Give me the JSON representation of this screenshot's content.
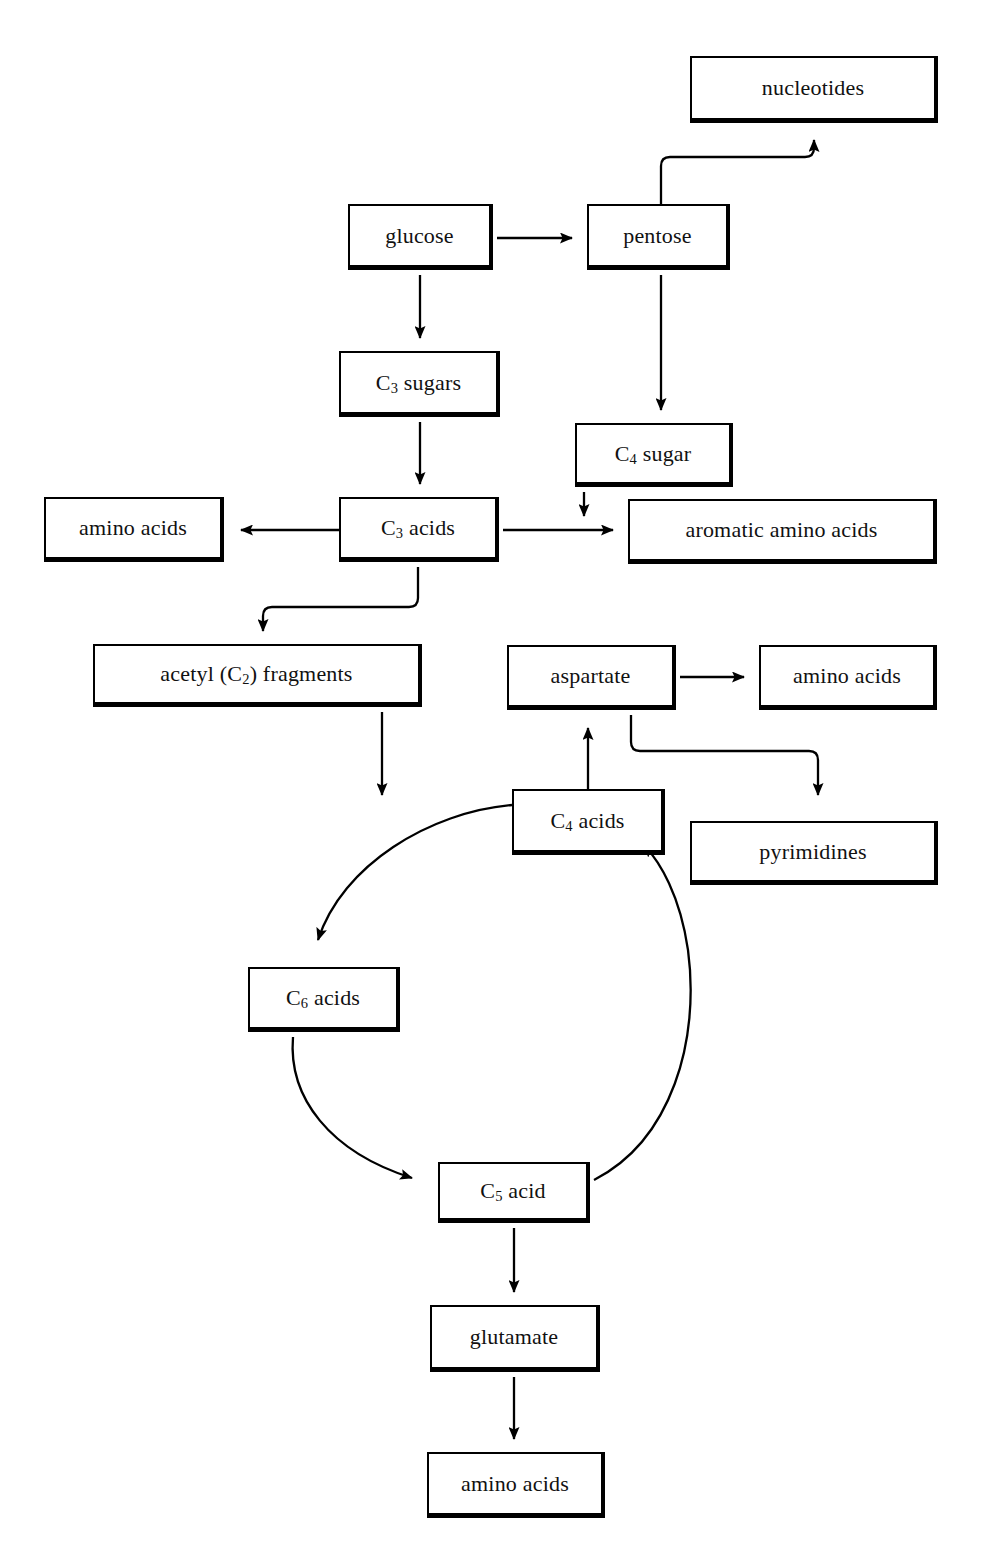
{
  "diagram": {
    "type": "flow-diagram",
    "background_color": "#ffffff",
    "line_color": "#000000",
    "box_fill_color": "#ffffff",
    "box_border_color": "#000000",
    "nodes": [
      {
        "id": "nucleotides",
        "label": "nucleotides",
        "x": 690,
        "y": 56,
        "w": 248,
        "h": 67
      },
      {
        "id": "glucose",
        "label": "glucose",
        "x": 348,
        "y": 204,
        "w": 145,
        "h": 66
      },
      {
        "id": "pentose",
        "label": "pentose",
        "x": 587,
        "y": 204,
        "w": 143,
        "h": 66
      },
      {
        "id": "c3sugars",
        "label": "C",
        "sub": "3",
        "label_tail": " sugars",
        "x": 339,
        "y": 351,
        "w": 161,
        "h": 66
      },
      {
        "id": "c4sugar",
        "label": "C",
        "sub": "4",
        "label_tail": " sugar",
        "x": 575,
        "y": 423,
        "w": 158,
        "h": 64
      },
      {
        "id": "aminoacids1",
        "label": "amino acids",
        "x": 44,
        "y": 497,
        "w": 180,
        "h": 65
      },
      {
        "id": "c3acids",
        "label": "C",
        "sub": "3",
        "label_tail": " acids",
        "x": 339,
        "y": 497,
        "w": 160,
        "h": 65
      },
      {
        "id": "aromatic",
        "label": "aromatic amino acids",
        "x": 628,
        "y": 499,
        "w": 309,
        "h": 65
      },
      {
        "id": "acetyl",
        "label": "acetyl (C",
        "sub": "2",
        "label_tail": ") fragments",
        "x": 93,
        "y": 644,
        "w": 329,
        "h": 63
      },
      {
        "id": "aspartate",
        "label": "aspartate",
        "x": 507,
        "y": 645,
        "w": 169,
        "h": 65
      },
      {
        "id": "aminoacids2",
        "label": "amino acids",
        "x": 759,
        "y": 645,
        "w": 178,
        "h": 65
      },
      {
        "id": "c4acids",
        "label": "C",
        "sub": "4",
        "label_tail": " acids",
        "x": 512,
        "y": 789,
        "w": 153,
        "h": 66
      },
      {
        "id": "pyrimidines",
        "label": "pyrimidines",
        "x": 690,
        "y": 821,
        "w": 248,
        "h": 64
      },
      {
        "id": "c6acids",
        "label": "C",
        "sub": "6",
        "label_tail": " acids",
        "x": 248,
        "y": 967,
        "w": 152,
        "h": 65
      },
      {
        "id": "c5acid",
        "label": "C",
        "sub": "5",
        "label_tail": " acid",
        "x": 438,
        "y": 1162,
        "w": 152,
        "h": 61
      },
      {
        "id": "glutamate",
        "label": "glutamate",
        "x": 430,
        "y": 1305,
        "w": 170,
        "h": 67
      },
      {
        "id": "aminoacids3",
        "label": "amino acids",
        "x": 427,
        "y": 1452,
        "w": 178,
        "h": 66
      }
    ],
    "edges": [
      {
        "id": "glucose-to-pentose",
        "from": "glucose",
        "to": "pentose",
        "style": "straight-horizontal"
      },
      {
        "id": "glucose-to-c3sugars",
        "from": "glucose",
        "to": "c3sugars",
        "style": "straight-vertical"
      },
      {
        "id": "pentose-to-nucleotides",
        "from": "pentose",
        "to": "nucleotides",
        "style": "elbow-up-right"
      },
      {
        "id": "pentose-to-c4sugar",
        "from": "pentose",
        "to": "c4sugar",
        "style": "straight-vertical"
      },
      {
        "id": "c3sugars-to-c3acids",
        "from": "c3sugars",
        "to": "c3acids",
        "style": "straight-vertical"
      },
      {
        "id": "c3acids-to-aminoacids1",
        "from": "c3acids",
        "to": "aminoacids1",
        "style": "straight-horizontal-left"
      },
      {
        "id": "c3acids-to-aromatic",
        "from": "c3acids",
        "to": "aromatic",
        "style": "straight-horizontal"
      },
      {
        "id": "c4sugar-to-aromatic",
        "from": "c4sugar",
        "to": "aromatic",
        "style": "straight-vertical"
      },
      {
        "id": "c3acids-to-acetyl",
        "from": "c3acids",
        "to": "acetyl",
        "style": "elbow-down-left"
      },
      {
        "id": "acetyl-to-c6acids",
        "from": "acetyl",
        "to": "c6acids",
        "style": "straight-vertical"
      },
      {
        "id": "aspartate-to-aminoacids2",
        "from": "aspartate",
        "to": "aminoacids2",
        "style": "straight-horizontal"
      },
      {
        "id": "aspartate-to-pyrimidines",
        "from": "aspartate",
        "to": "pyrimidines",
        "style": "elbow-down-right"
      },
      {
        "id": "c4acids-to-aspartate",
        "from": "c4acids",
        "to": "aspartate",
        "style": "straight-vertical-up"
      },
      {
        "id": "c4acids-to-c6acids",
        "from": "c4acids",
        "to": "c6acids",
        "style": "cycle-arc-left"
      },
      {
        "id": "c6acids-to-c5acid",
        "from": "c6acids",
        "to": "c5acid",
        "style": "cycle-arc-bottom-left"
      },
      {
        "id": "c5acid-to-c4acids",
        "from": "c5acid",
        "to": "c4acids",
        "style": "cycle-arc-right"
      },
      {
        "id": "c5acid-to-glutamate",
        "from": "c5acid",
        "to": "glutamate",
        "style": "straight-vertical"
      },
      {
        "id": "glutamate-to-aminoacids3",
        "from": "glutamate",
        "to": "aminoacids3",
        "style": "straight-vertical"
      }
    ]
  }
}
